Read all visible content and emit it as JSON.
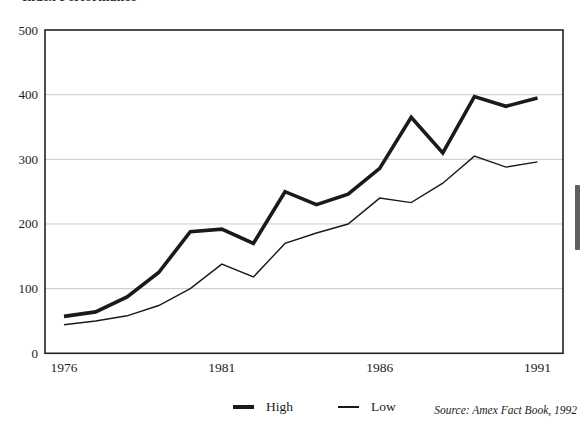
{
  "page": {
    "clipped_title": "Index Performance"
  },
  "chart_data": {
    "type": "line",
    "title": "Index Performance",
    "x": [
      1976,
      1977,
      1978,
      1979,
      1980,
      1981,
      1982,
      1983,
      1984,
      1985,
      1986,
      1987,
      1988,
      1989,
      1990,
      1991
    ],
    "series": [
      {
        "name": "High",
        "style": "thick",
        "values": [
          57,
          64,
          87,
          125,
          188,
          192,
          170,
          250,
          230,
          246,
          286,
          365,
          310,
          397,
          382,
          395
        ]
      },
      {
        "name": "Low",
        "style": "thin",
        "values": [
          44,
          50,
          58,
          74,
          100,
          138,
          118,
          170,
          186,
          200,
          240,
          233,
          263,
          305,
          288,
          296
        ]
      }
    ],
    "ylim": [
      0,
      500
    ],
    "yticks": [
      0,
      100,
      200,
      300,
      400,
      500
    ],
    "xticks": [
      1976,
      1981,
      1986,
      1991
    ],
    "grid": "horizontal",
    "legend_position": "bottom-center",
    "source_note": "Source: Amex Fact Book, 1992"
  },
  "legend": {
    "items": [
      {
        "label": "High"
      },
      {
        "label": "Low"
      }
    ]
  },
  "footer": {
    "source": "Source: Amex Fact Book, 1992"
  },
  "colors": {
    "background": "#ffffff",
    "line": "#1a1a1a",
    "grid": "#c9c9c9",
    "frame": "#222222",
    "scrollbar_thumb": "#5f5f61"
  }
}
